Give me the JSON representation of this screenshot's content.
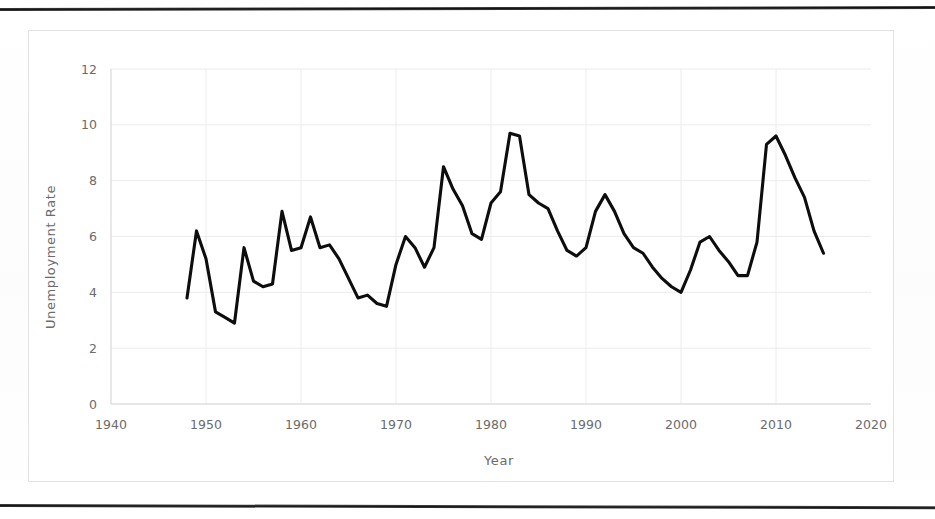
{
  "chart_data": {
    "type": "line",
    "title": "",
    "xlabel": "Year",
    "ylabel": "Unemployment Rate",
    "xlim": [
      1940,
      2020
    ],
    "ylim": [
      0,
      12
    ],
    "xticks": [
      "1940",
      "1950",
      "1960",
      "1970",
      "1980",
      "1990",
      "2000",
      "2010",
      "2020"
    ],
    "yticks": [
      "0",
      "2",
      "4",
      "6",
      "8",
      "10",
      "12"
    ],
    "grid": true,
    "legend": "none",
    "series": [
      {
        "name": "Unemployment Rate",
        "color": "#0d0d0d",
        "x": [
          1948,
          1949,
          1950,
          1951,
          1952,
          1953,
          1954,
          1955,
          1956,
          1957,
          1958,
          1959,
          1960,
          1961,
          1962,
          1963,
          1964,
          1965,
          1966,
          1967,
          1968,
          1969,
          1970,
          1971,
          1972,
          1973,
          1974,
          1975,
          1976,
          1977,
          1978,
          1979,
          1980,
          1981,
          1982,
          1983,
          1984,
          1985,
          1986,
          1987,
          1988,
          1989,
          1990,
          1991,
          1992,
          1993,
          1994,
          1995,
          1996,
          1997,
          1998,
          1999,
          2000,
          2001,
          2002,
          2003,
          2004,
          2005,
          2006,
          2007,
          2008,
          2009,
          2010,
          2011,
          2012,
          2013,
          2014,
          2015
        ],
        "values": [
          3.8,
          6.2,
          5.2,
          3.3,
          3.1,
          2.9,
          5.6,
          4.4,
          4.2,
          4.3,
          6.9,
          5.5,
          5.6,
          6.7,
          5.6,
          5.7,
          5.2,
          4.5,
          3.8,
          3.9,
          3.6,
          3.5,
          5.0,
          6.0,
          5.6,
          4.9,
          5.6,
          8.5,
          7.7,
          7.1,
          6.1,
          5.9,
          7.2,
          7.6,
          9.7,
          9.6,
          7.5,
          7.2,
          7.0,
          6.2,
          5.5,
          5.3,
          5.6,
          6.9,
          7.5,
          6.9,
          6.1,
          5.6,
          5.4,
          4.9,
          4.5,
          4.2,
          4.0,
          4.8,
          5.8,
          6.0,
          5.5,
          5.1,
          4.6,
          4.6,
          5.8,
          9.3,
          9.6,
          8.9,
          8.1,
          7.4,
          6.2,
          5.4
        ]
      }
    ]
  },
  "axes": {
    "y_axis_label": "Unemployment Rate",
    "x_axis_label": "Year"
  }
}
